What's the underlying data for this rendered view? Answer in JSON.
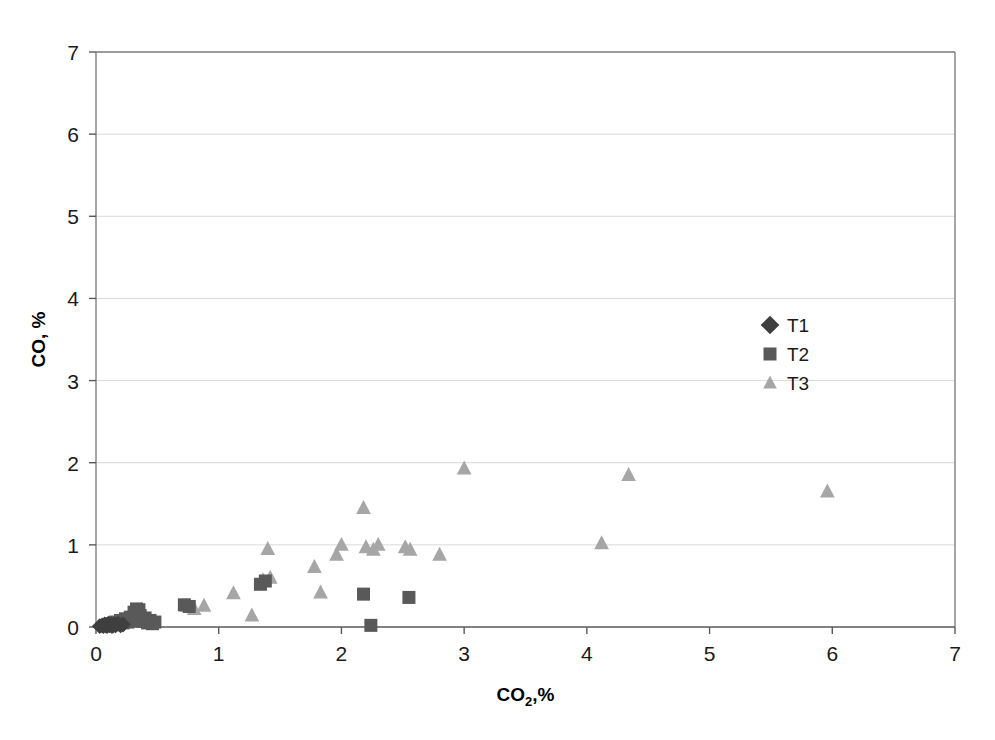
{
  "chart_data": {
    "type": "scatter",
    "title": "",
    "xlabel": "CO2,%",
    "xlabel_main": "CO",
    "xlabel_sub": "2",
    "xlabel_tail": ",%",
    "ylabel": "CO, %",
    "xlim": [
      0,
      7
    ],
    "ylim": [
      0,
      7
    ],
    "xticks": [
      0,
      1,
      2,
      3,
      4,
      5,
      6,
      7
    ],
    "yticks": [
      0,
      1,
      2,
      3,
      4,
      5,
      6,
      7
    ],
    "xticklabels": [
      "0",
      "1",
      "2",
      "3",
      "4",
      "5",
      "6",
      "7"
    ],
    "yticklabels": [
      "0",
      "1",
      "2",
      "3",
      "4",
      "5",
      "6",
      "7"
    ],
    "grid": "horizontal",
    "grid_color": "#d9d9d9",
    "axis_color": "#808080",
    "legend_position": "inside-upper-right",
    "series": [
      {
        "name": "T1",
        "marker": "diamond",
        "color": "#3f3f3f",
        "size": 11,
        "points": [
          [
            0.03,
            0.01
          ],
          [
            0.05,
            0.02
          ],
          [
            0.06,
            0.01
          ],
          [
            0.07,
            0.03
          ],
          [
            0.08,
            0.02
          ],
          [
            0.09,
            0.01
          ],
          [
            0.1,
            0.04
          ],
          [
            0.11,
            0.02
          ],
          [
            0.12,
            0.03
          ],
          [
            0.13,
            0.01
          ],
          [
            0.14,
            0.02
          ],
          [
            0.15,
            0.03
          ],
          [
            0.16,
            0.02
          ],
          [
            0.18,
            0.04
          ],
          [
            0.2,
            0.02
          ],
          [
            0.22,
            0.03
          ]
        ]
      },
      {
        "name": "T2",
        "marker": "square",
        "color": "#595959",
        "size": 13,
        "points": [
          [
            0.12,
            0.04
          ],
          [
            0.16,
            0.06
          ],
          [
            0.18,
            0.03
          ],
          [
            0.2,
            0.08
          ],
          [
            0.22,
            0.05
          ],
          [
            0.24,
            0.1
          ],
          [
            0.26,
            0.06
          ],
          [
            0.28,
            0.12
          ],
          [
            0.3,
            0.08
          ],
          [
            0.31,
            0.18
          ],
          [
            0.33,
            0.22
          ],
          [
            0.34,
            0.09
          ],
          [
            0.35,
            0.21
          ],
          [
            0.36,
            0.14
          ],
          [
            0.38,
            0.07
          ],
          [
            0.4,
            0.11
          ],
          [
            0.42,
            0.05
          ],
          [
            0.44,
            0.08
          ],
          [
            0.46,
            0.04
          ],
          [
            0.48,
            0.06
          ],
          [
            0.72,
            0.27
          ],
          [
            0.76,
            0.25
          ],
          [
            1.34,
            0.52
          ],
          [
            1.38,
            0.56
          ],
          [
            2.18,
            0.4
          ],
          [
            2.24,
            0.02
          ],
          [
            2.55,
            0.36
          ]
        ]
      },
      {
        "name": "T3",
        "marker": "triangle",
        "color": "#a6a6a6",
        "size": 14,
        "points": [
          [
            0.74,
            0.26
          ],
          [
            0.8,
            0.22
          ],
          [
            0.88,
            0.26
          ],
          [
            1.12,
            0.41
          ],
          [
            1.27,
            0.14
          ],
          [
            1.36,
            0.57
          ],
          [
            1.4,
            0.95
          ],
          [
            1.42,
            0.6
          ],
          [
            1.78,
            0.73
          ],
          [
            1.83,
            0.42
          ],
          [
            1.96,
            0.88
          ],
          [
            2.0,
            1.0
          ],
          [
            2.18,
            1.45
          ],
          [
            2.2,
            0.97
          ],
          [
            2.26,
            0.94
          ],
          [
            2.3,
            1.0
          ],
          [
            2.52,
            0.97
          ],
          [
            2.56,
            0.94
          ],
          [
            2.8,
            0.88
          ],
          [
            3.0,
            1.93
          ],
          [
            4.12,
            1.02
          ],
          [
            4.34,
            1.85
          ],
          [
            5.96,
            1.65
          ]
        ]
      }
    ]
  },
  "legend": {
    "entries": [
      {
        "label": "T1",
        "marker": "diamond",
        "color": "#3f3f3f"
      },
      {
        "label": "T2",
        "marker": "square",
        "color": "#595959"
      },
      {
        "label": "T3",
        "marker": "triangle",
        "color": "#a6a6a6"
      }
    ]
  }
}
